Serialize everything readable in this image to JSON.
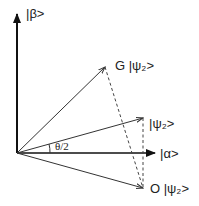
{
  "diagram": {
    "type": "vector-diagram",
    "colors": {
      "stroke": "#333333",
      "axis": "#111111",
      "background": "#ffffff"
    },
    "axes": {
      "vertical": {
        "label": "|β>"
      },
      "horizontal": {
        "label": "|α>"
      }
    },
    "vectors": [
      {
        "id": "G_psi2",
        "label": "G |ψ₂>"
      },
      {
        "id": "psi2",
        "label": "|ψ₂>"
      },
      {
        "id": "O_psi2",
        "label": "O |ψ₂>"
      }
    ],
    "angle": {
      "label": "θ/2"
    },
    "dashed_lines": [
      {
        "from": "G_psi2",
        "to": "O_psi2"
      },
      {
        "from": "psi2",
        "to": "O_psi2"
      }
    ]
  }
}
